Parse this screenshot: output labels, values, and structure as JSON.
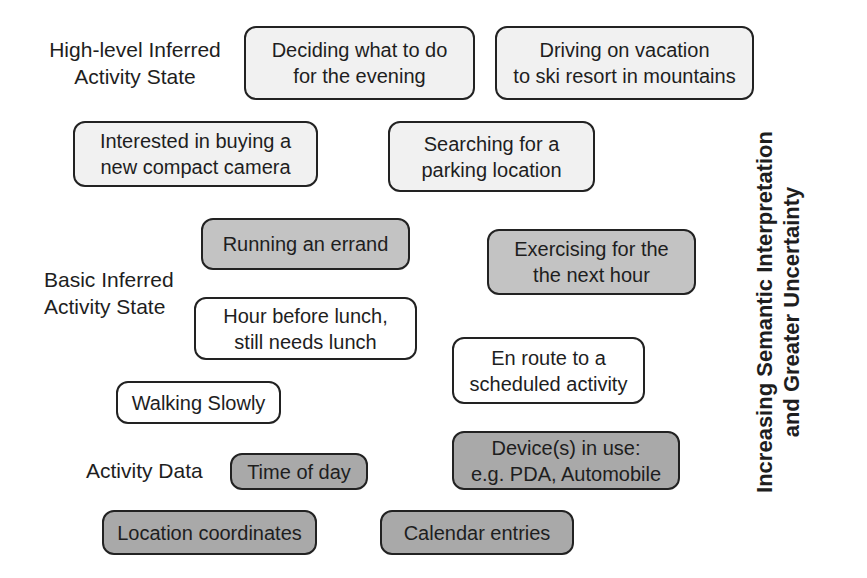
{
  "diagram": {
    "level_labels": {
      "high": {
        "line1": "High-level Inferred",
        "line2": "Activity State"
      },
      "basic": {
        "line1": "Basic Inferred",
        "line2": "Activity State"
      },
      "data": {
        "line1": "Activity Data"
      }
    },
    "axis_caption": {
      "line1": "Increasing Semantic Interpretation",
      "line2": "and Greater Uncertainty"
    },
    "colors": {
      "high_fill": "#f1f1f1",
      "basic_gray_fill": "#c3c3c3",
      "basic_white_fill": "#ffffff",
      "data_fill": "#a9a9a9",
      "border": "#222222"
    },
    "boxes": {
      "deciding_evening": "Deciding what to do\nfor the evening",
      "driving_vacation": "Driving on vacation\nto ski resort in mountains",
      "interested_camera": "Interested in buying a\nnew compact camera",
      "searching_parking": "Searching for a\nparking location",
      "running_errand": "Running an errand",
      "exercising": "Exercising for the\nthe next hour",
      "hour_before_lunch": "Hour before lunch,\nstill needs lunch",
      "en_route": "En route to a\nscheduled activity",
      "walking_slowly": "Walking Slowly",
      "time_of_day": "Time of day",
      "devices_in_use": "Device(s) in use:\ne.g. PDA, Automobile",
      "location_coordinates": "Location coordinates",
      "calendar_entries": "Calendar entries"
    }
  }
}
